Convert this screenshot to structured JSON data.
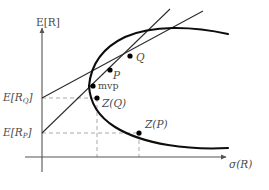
{
  "figure": {
    "type": "diagram",
    "background_color": "#ffffff",
    "curve_color": "#111111",
    "line_color": "#333333",
    "dash_color": "#9a9a9a",
    "label_color": "#4a4a4a"
  },
  "axes": {
    "y_label": "E[R]",
    "x_label_symbol": "σ",
    "x_label_arg": "(R)",
    "origin": {
      "x": 42,
      "y": 157
    },
    "y_axis_top": 27,
    "x_axis_right": 228
  },
  "ticks": {
    "y": [
      {
        "id": "E_RQ",
        "base": "E[R",
        "sub": "Q",
        "close": "]",
        "pixel_y": 98
      },
      {
        "id": "E_RP",
        "base": "E[R",
        "sub": "P",
        "close": "]",
        "pixel_y": 133
      }
    ]
  },
  "points": [
    {
      "id": "Q",
      "label": "Q",
      "sub": "",
      "x": 130,
      "y": 56,
      "on": "efficient-frontier"
    },
    {
      "id": "P",
      "label": "P",
      "sub": "",
      "x": 110,
      "y": 70,
      "on": "efficient-frontier"
    },
    {
      "id": "mvp",
      "label": "mvp",
      "sub": "",
      "x": 93,
      "y": 86,
      "on": "frontier-vertex"
    },
    {
      "id": "Z_Q",
      "label": "Z(Q)",
      "sub": "",
      "x": 97,
      "y": 98,
      "on": "lower-branch"
    },
    {
      "id": "Z_P",
      "label": "Z(P)",
      "sub": "",
      "x": 139,
      "y": 133,
      "on": "lower-branch"
    }
  ],
  "tangent_lines": [
    {
      "id": "tangent-through-Q",
      "intercept_label": "E_RQ",
      "from": {
        "x": 42,
        "y": 98
      },
      "to": {
        "x": 200,
        "y": 10
      },
      "touches": "Q"
    },
    {
      "id": "tangent-through-P",
      "intercept_label": "E_RP",
      "from": {
        "x": 42,
        "y": 133
      },
      "to": {
        "x": 168,
        "y": 9
      },
      "touches": "P"
    }
  ],
  "dashed_guides": [
    {
      "id": "hline-ERQ-to-ZQ",
      "orientation": "horizontal",
      "from": {
        "x": 42,
        "y": 98
      },
      "to": {
        "x": 97,
        "y": 98
      }
    },
    {
      "id": "hline-ERP-to-ZP",
      "orientation": "horizontal",
      "from": {
        "x": 42,
        "y": 133
      },
      "to": {
        "x": 139,
        "y": 133
      }
    },
    {
      "id": "vline-ZQ-to-axis",
      "orientation": "vertical",
      "from": {
        "x": 97,
        "y": 98
      },
      "to": {
        "x": 97,
        "y": 157
      }
    },
    {
      "id": "vline-ZP-to-axis",
      "orientation": "vertical",
      "from": {
        "x": 139,
        "y": 133
      },
      "to": {
        "x": 139,
        "y": 157
      }
    }
  ],
  "frontier": {
    "vertex": {
      "x": 89,
      "y": 86
    },
    "upper_branch_end": {
      "x": 228,
      "y": 34
    },
    "lower_branch_end": {
      "x": 228,
      "y": 148
    }
  }
}
